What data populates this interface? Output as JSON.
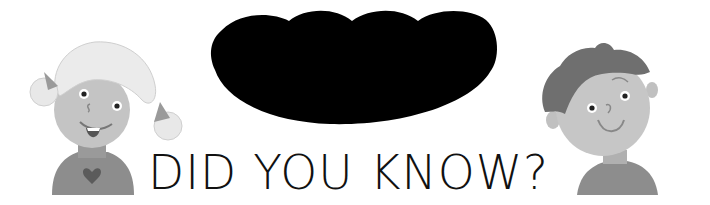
{
  "banner": {
    "headline": "DID YOU KNOW?",
    "colors": {
      "background": "#ffffff",
      "cloud": "#000000",
      "text": "#111111",
      "skin": "#c8c8c8",
      "hair_girl": "#e6e6e6",
      "hair_boy": "#6e6e6e",
      "shirt": "#8a8a8a",
      "heart": "#5a5a5a"
    }
  },
  "illustrations": {
    "left": "girl-character",
    "right": "boy-character",
    "center": "black-speech-cloud"
  }
}
